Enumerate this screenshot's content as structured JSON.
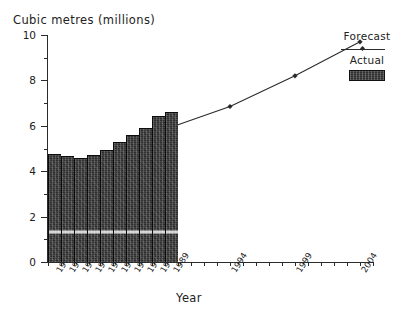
{
  "chart_data": {
    "type": "bar",
    "title": "",
    "ylabel": "Cubic metres (millions)",
    "xlabel": "Year",
    "ylim": [
      0,
      10
    ],
    "y_ticks_major": [
      0,
      2,
      4,
      6,
      8,
      10
    ],
    "y_ticks_minor": [
      1,
      3,
      5,
      7,
      9
    ],
    "y_tick_labels": [
      "0",
      "2",
      "4",
      "6",
      "8",
      "10"
    ],
    "grid": false,
    "legend_position": "top-right",
    "x_range": [
      1980,
      2005
    ],
    "categories": [
      "1980",
      "1981",
      "1982",
      "1983",
      "1984",
      "1985",
      "1986",
      "1987",
      "1988",
      "1989"
    ],
    "series": [
      {
        "name": "Actual",
        "type": "bar",
        "values": [
          4.75,
          4.65,
          4.6,
          4.7,
          4.95,
          5.3,
          5.6,
          5.9,
          6.45,
          6.6
        ]
      },
      {
        "name": "Forecast",
        "type": "line",
        "x": [
          1989,
          1994,
          1999,
          2004
        ],
        "values": [
          6.05,
          6.85,
          8.2,
          9.7
        ]
      }
    ],
    "x_forecast_tick_labels": [
      "1994",
      "1999",
      "2004"
    ],
    "colors": {
      "bar_fill": "#2e2e2e",
      "line": "#2b2b2b",
      "axis": "#2b2b2b",
      "text": "#222222",
      "background": "#ffffff"
    }
  },
  "legend": {
    "forecast_label": "Forecast",
    "actual_label": "Actual"
  }
}
